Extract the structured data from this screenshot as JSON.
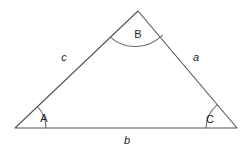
{
  "figure": {
    "kind": "geometry-diagram",
    "shape": "triangle",
    "background_color": "#ffffff",
    "line_color": "#55565a",
    "arc_color": "#6b6c70",
    "text_color": "#1d1d1f",
    "width": 249,
    "height": 152
  },
  "vertices": [
    {
      "id": "A",
      "label": "A",
      "x": 15,
      "y": 128,
      "label_x": 44,
      "label_y": 119,
      "arc_radius": 31,
      "arc_start_deg": 0,
      "arc_end_deg": 43.6
    },
    {
      "id": "B",
      "label": "B",
      "x": 138,
      "y": 11,
      "label_x": 138,
      "label_y": 35,
      "arc_radius": 38,
      "arc_start_deg": 223.6,
      "arc_end_deg": 310.2
    },
    {
      "id": "C",
      "label": "C",
      "x": 237,
      "y": 128,
      "label_x": 210,
      "label_y": 120,
      "arc_radius": 31,
      "arc_start_deg": 130.2,
      "arc_end_deg": 180
    }
  ],
  "sides": [
    {
      "id": "a",
      "label": "a",
      "from": "B",
      "to": "C",
      "label_x": 196,
      "label_y": 58,
      "italic": true
    },
    {
      "id": "b",
      "label": "b",
      "from": "A",
      "to": "C",
      "label_x": 127,
      "label_y": 141,
      "italic": true
    },
    {
      "id": "c",
      "label": "c",
      "from": "A",
      "to": "B",
      "label_x": 64,
      "label_y": 58,
      "italic": true
    }
  ],
  "paths": {
    "triangle_outline": "M 15 128 L 138 11 L 237 128 Z",
    "arc_A": "M 46 128 A 31 31 0 0 0 37.45 106.62",
    "arc_B": "M 110.5 37.4 A 38 38 0 0 0 162.4 35.2",
    "arc_C": "M 217 105.2 A 31 31 0 0 0 206 128",
    "arc_A_alt": "",
    "arc_B_alt": "",
    "arc_C_alt": ""
  }
}
